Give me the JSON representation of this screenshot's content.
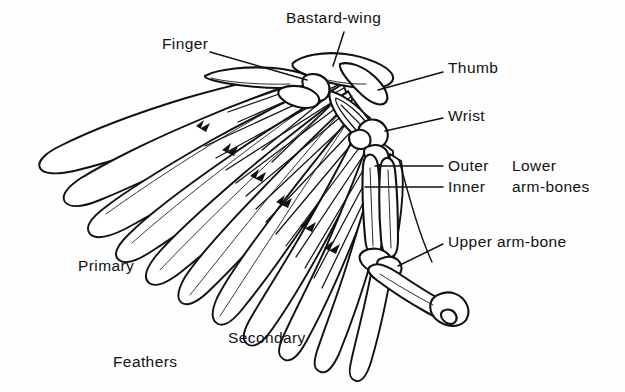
{
  "figure": {
    "background_color": "#fefefe",
    "ink_color": "#111111"
  },
  "labels": {
    "bastard_wing": "Bastard-wing",
    "finger": "Finger",
    "thumb": "Thumb",
    "wrist": "Wrist",
    "outer": "Outer",
    "inner": "Inner",
    "lower": "Lower",
    "arm_bones": "arm-bones",
    "upper_arm_bone": "Upper arm-bone",
    "primary": "Primary",
    "secondary": "Secondary",
    "feathers": "Feathers"
  },
  "parts": {
    "feather_groups": [
      "Primary",
      "Secondary"
    ],
    "bones": [
      "Thumb",
      "Finger",
      "Wrist",
      "Outer",
      "Inner",
      "Upper arm-bone"
    ],
    "bone_groups": [
      "Lower arm-bones"
    ]
  }
}
